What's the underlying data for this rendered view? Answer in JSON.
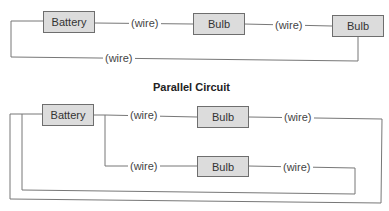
{
  "series_circuit": {
    "components": [
      {
        "id": "battery",
        "label": "Battery"
      },
      {
        "id": "bulb1",
        "label": "Bulb"
      },
      {
        "id": "bulb2",
        "label": "Bulb"
      }
    ],
    "wires": [
      {
        "label": "(wire)"
      },
      {
        "label": "(wire)"
      },
      {
        "label": "(wire)"
      }
    ]
  },
  "parallel_circuit": {
    "title": "Parallel Circuit",
    "components": [
      {
        "id": "battery",
        "label": "Battery"
      },
      {
        "id": "bulb_top",
        "label": "Bulb"
      },
      {
        "id": "bulb_bottom",
        "label": "Bulb"
      }
    ],
    "wires": [
      {
        "label": "(wire)"
      },
      {
        "label": "(wire)"
      },
      {
        "label": "(wire)"
      },
      {
        "label": "(wire)"
      }
    ]
  },
  "colors": {
    "box_fill": "#dcdcdc",
    "box_border": "#6e6e6e",
    "wire": "#777777"
  }
}
